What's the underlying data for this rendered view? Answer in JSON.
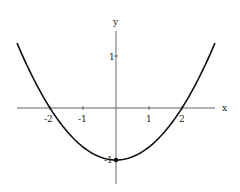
{
  "chart_data": {
    "type": "line",
    "title": "",
    "xlabel": "x",
    "ylabel": "y",
    "equation": "y = x^2/4 - 1",
    "xlim": [
      -3,
      3
    ],
    "ylim": [
      -1.5,
      1.5
    ],
    "x_ticks": [
      "-2",
      "-1",
      "1",
      "2"
    ],
    "y_ticks": [
      "1",
      "-1"
    ],
    "grid": false,
    "legend": null,
    "series": [
      {
        "name": "parabola",
        "x": [
          -3,
          -2.5,
          -2,
          -1.5,
          -1,
          -0.5,
          0,
          0.5,
          1,
          1.5,
          2,
          2.5,
          3
        ],
        "y": [
          1.25,
          0.5625,
          0,
          -0.4375,
          -0.75,
          -0.9375,
          -1,
          -0.9375,
          -0.75,
          -0.4375,
          0,
          0.5625,
          1.25
        ]
      }
    ],
    "annotations": [
      {
        "type": "point",
        "x": 0,
        "y": -1,
        "label": "vertex"
      }
    ]
  }
}
